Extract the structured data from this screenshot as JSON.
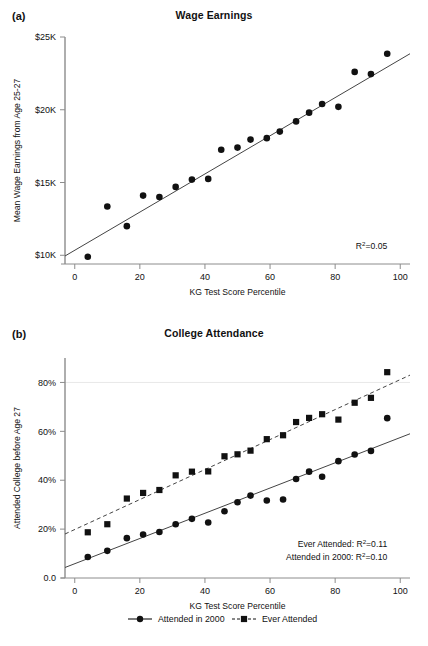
{
  "figure": {
    "width": 428,
    "height": 646,
    "background": "#ffffff",
    "ink": "#111111",
    "line_color": "#444444",
    "gridline_color": "#e8e8e8"
  },
  "panels": [
    {
      "key": "a",
      "label": "(a)",
      "title": "Wage Earnings"
    },
    {
      "key": "b",
      "label": "(b)",
      "title": "College Attendance"
    }
  ],
  "legend": {
    "position": "bottom-center",
    "items": [
      {
        "label": "Attended in 2000",
        "marker": "circle",
        "line": "solid"
      },
      {
        "label": "Ever Attended",
        "marker": "square",
        "line": "dashed"
      }
    ]
  },
  "chart_data": [
    {
      "type": "scatter",
      "panel": "a",
      "title": "Wage Earnings",
      "xlabel": "KG Test Score Percentile",
      "ylabel": "Mean Wage Earnings from Age 25-27",
      "xlim": [
        -3,
        103
      ],
      "ylim": [
        9400,
        25000
      ],
      "xticks": [
        0,
        20,
        40,
        60,
        80,
        100
      ],
      "xticklabels": [
        "0",
        "20",
        "40",
        "60",
        "80",
        "100"
      ],
      "yticks": [
        10000,
        15000,
        20000,
        25000
      ],
      "yticklabels": [
        "$10K",
        "$15K",
        "$20K",
        "$25K"
      ],
      "grid": false,
      "legend": false,
      "annotations": [
        {
          "text": "R2=0.05",
          "text_pre": "R",
          "text_sup": "2",
          "text_post": "=0.05",
          "x": 96,
          "y": 10400,
          "align": "right"
        }
      ],
      "series": [
        {
          "name": "Mean Wage Earnings",
          "marker": "circle",
          "x": [
            4,
            10,
            16,
            21,
            26,
            31,
            36,
            41,
            45,
            50,
            54,
            59,
            63,
            68,
            72,
            76,
            81,
            86,
            91,
            96
          ],
          "y": [
            9900,
            13350,
            12000,
            14100,
            14000,
            14700,
            15200,
            15250,
            17250,
            17400,
            17950,
            18050,
            18500,
            19200,
            19800,
            20400,
            20200,
            22600,
            22450,
            23850
          ],
          "fit": {
            "type": "linear",
            "x": [
              -3,
              103
            ],
            "y": [
              9950,
              23850
            ]
          }
        }
      ]
    },
    {
      "type": "scatter",
      "panel": "b",
      "title": "College Attendance",
      "xlabel": "KG Test Score Percentile",
      "ylabel": "Attended College before Age 27",
      "xlim": [
        -3,
        103
      ],
      "ylim": [
        0,
        90
      ],
      "xticks": [
        0,
        20,
        40,
        60,
        80,
        100
      ],
      "xticklabels": [
        "0",
        "20",
        "40",
        "60",
        "80",
        "100"
      ],
      "yticks": [
        0,
        20,
        40,
        60,
        80
      ],
      "yticklabels": [
        "0.0",
        "20%",
        "40%",
        "60%",
        "80%"
      ],
      "grid": true,
      "gridlines_y": [
        80
      ],
      "legend": true,
      "annotations": [
        {
          "text": "Ever Attended: R2=0.11",
          "text_pre": "Ever Attended: R",
          "text_sup": "2",
          "text_post": "=0.11",
          "x": 96,
          "y": 12.5,
          "align": "right"
        },
        {
          "text": "Attended in 2000: R2=0.10",
          "text_pre": "Attended in 2000: R",
          "text_sup": "2",
          "text_post": "=0.10",
          "x": 96,
          "y": 7.5,
          "align": "right"
        }
      ],
      "series": [
        {
          "name": "Ever Attended",
          "marker": "square",
          "linestyle": "dashed",
          "x": [
            4,
            10,
            16,
            21,
            26,
            31,
            36,
            41,
            46,
            50,
            54,
            59,
            64,
            68,
            72,
            76,
            81,
            86,
            91,
            96
          ],
          "y": [
            18.7,
            22.0,
            32.5,
            34.8,
            36.0,
            42.0,
            43.5,
            43.6,
            49.8,
            50.6,
            52.1,
            56.8,
            58.4,
            63.8,
            65.5,
            67.0,
            64.8,
            71.7,
            73.7,
            84.2
          ],
          "fit": {
            "type": "linear",
            "x": [
              -3,
              103
            ],
            "y": [
              18.0,
              83.0
            ]
          }
        },
        {
          "name": "Attended in 2000",
          "marker": "circle",
          "linestyle": "solid",
          "x": [
            4,
            10,
            16,
            21,
            26,
            31,
            36,
            41,
            46,
            50,
            54,
            59,
            64,
            68,
            72,
            76,
            81,
            86,
            91,
            96
          ],
          "y": [
            8.6,
            11.1,
            16.3,
            17.8,
            18.8,
            22.0,
            24.2,
            22.7,
            27.3,
            31.0,
            33.7,
            31.7,
            32.1,
            40.5,
            43.5,
            41.4,
            47.8,
            50.5,
            52.0,
            65.4
          ],
          "fit": {
            "type": "linear",
            "x": [
              -3,
              103
            ],
            "y": [
              4.3,
              59.0
            ]
          }
        }
      ]
    }
  ]
}
